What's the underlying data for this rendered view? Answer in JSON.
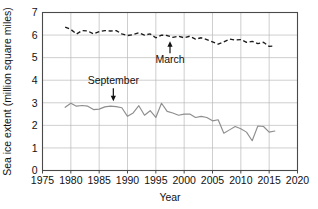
{
  "chart_data": {
    "type": "line",
    "title": "",
    "xlabel": "Year",
    "ylabel": "Sea ice extent (million square miles)",
    "xlim": [
      1975,
      2020
    ],
    "ylim": [
      0,
      7
    ],
    "xticks": [
      1975,
      1980,
      1985,
      1990,
      1995,
      2000,
      2005,
      2010,
      2015,
      2020
    ],
    "yticks": [
      0,
      1,
      2,
      3,
      4,
      5,
      6,
      7
    ],
    "grid": true,
    "legend_position": "inline-annotations",
    "series": [
      {
        "name": "March",
        "style": "dashed",
        "color": "#1b1b1b",
        "x": [
          1979,
          1980,
          1981,
          1982,
          1983,
          1984,
          1985,
          1986,
          1987,
          1988,
          1989,
          1990,
          1991,
          1992,
          1993,
          1994,
          1995,
          1996,
          1997,
          1998,
          1999,
          2000,
          2001,
          2002,
          2003,
          2004,
          2005,
          2006,
          2007,
          2008,
          2009,
          2010,
          2011,
          2012,
          2013,
          2014,
          2015,
          2016
        ],
        "values": [
          6.35,
          6.25,
          6.05,
          6.2,
          6.18,
          6.05,
          6.15,
          6.2,
          6.18,
          6.2,
          6.05,
          5.98,
          6.02,
          6.1,
          6.0,
          6.05,
          5.88,
          6.0,
          5.98,
          5.9,
          5.95,
          5.88,
          5.95,
          5.82,
          5.88,
          5.8,
          5.7,
          5.6,
          5.7,
          5.82,
          5.78,
          5.8,
          5.68,
          5.72,
          5.62,
          5.68,
          5.5,
          5.52
        ]
      },
      {
        "name": "September",
        "style": "solid",
        "color": "#8e8e8e",
        "x": [
          1979,
          1980,
          1981,
          1982,
          1983,
          1984,
          1985,
          1986,
          1987,
          1988,
          1989,
          1990,
          1991,
          1992,
          1993,
          1994,
          1995,
          1996,
          1997,
          1998,
          1999,
          2000,
          2001,
          2002,
          2003,
          2004,
          2005,
          2006,
          2007,
          2008,
          2009,
          2010,
          2011,
          2012,
          2013,
          2014,
          2015,
          2016
        ],
        "values": [
          2.8,
          2.98,
          2.85,
          2.88,
          2.85,
          2.7,
          2.72,
          2.82,
          2.85,
          2.83,
          2.78,
          2.4,
          2.55,
          2.87,
          2.45,
          2.65,
          2.35,
          2.98,
          2.62,
          2.55,
          2.45,
          2.5,
          2.5,
          2.35,
          2.4,
          2.35,
          2.2,
          2.25,
          1.65,
          1.8,
          1.95,
          1.85,
          1.7,
          1.32,
          1.97,
          1.95,
          1.7,
          1.75
        ]
      }
    ],
    "annotations": [
      {
        "text": "March",
        "arrow": "up",
        "x_year": 1997.5,
        "y_value": 5.15
      },
      {
        "text": "September",
        "arrow": "down",
        "x_year": 1987.5,
        "y_value": 3.55
      }
    ]
  }
}
